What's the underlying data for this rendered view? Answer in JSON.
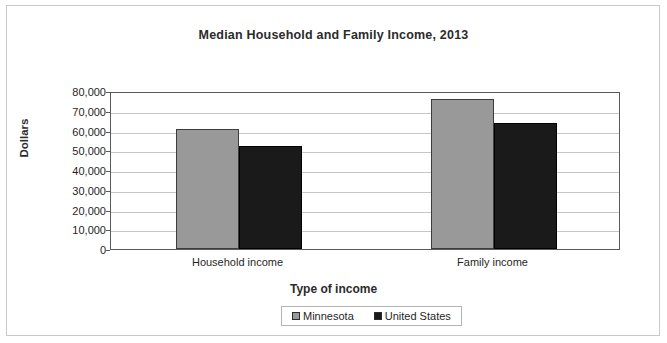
{
  "chart_data": {
    "type": "bar",
    "title": "Median Household and Family Income, 2013",
    "xlabel": "Type of income",
    "ylabel": "Dollars",
    "categories": [
      "Household income",
      "Family income"
    ],
    "series": [
      {
        "name": "Minnesota",
        "color": "#999999",
        "values": [
          60700,
          76000
        ]
      },
      {
        "name": "United States",
        "color": "#1a1a1a",
        "values": [
          52000,
          64000
        ]
      }
    ],
    "ylim": [
      0,
      80000
    ],
    "ytick_values": [
      0,
      10000,
      20000,
      30000,
      40000,
      50000,
      60000,
      70000,
      80000
    ],
    "ytick_labels": [
      "0",
      "10,000",
      "20,000",
      "30,000",
      "40,000",
      "50,000",
      "60,000",
      "70,000",
      "80,000"
    ],
    "grid": true,
    "legend_position": "bottom"
  },
  "legend": {
    "items": [
      {
        "label": "Minnesota",
        "swatch": "gray-square-icon"
      },
      {
        "label": "United States",
        "swatch": "black-square-icon"
      }
    ]
  }
}
